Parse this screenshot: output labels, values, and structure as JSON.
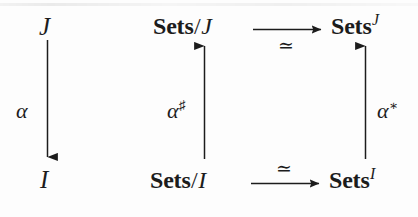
{
  "diagram": {
    "background_color": "#fdfdfd",
    "ink_color": "#1c1c1c",
    "nodes": {
      "top_left": {
        "text": "J"
      },
      "bottom_left": {
        "text": "I"
      },
      "top_mid": {
        "category": "Sets",
        "separator": "/",
        "index": "J"
      },
      "bottom_mid": {
        "category": "Sets",
        "separator": "/",
        "index": "I"
      },
      "top_right": {
        "category": "Sets",
        "superscript": "J"
      },
      "bottom_right": {
        "category": "Sets",
        "superscript": "I"
      }
    },
    "arrow_labels": {
      "alpha": {
        "base": "α",
        "sup": ""
      },
      "alpha_sharp": {
        "base": "α",
        "sup": "♯"
      },
      "alpha_star": {
        "base": "α",
        "sup": "∗"
      },
      "iso_top": {
        "text": "≃"
      },
      "iso_bottom": {
        "text": "≃"
      }
    },
    "arrows": [
      {
        "name": "alpha-arrow",
        "from": "J",
        "to": "I",
        "direction": "down",
        "label": "α"
      },
      {
        "name": "alpha-sharp-arrow",
        "from": "Sets/I",
        "to": "Sets/J",
        "direction": "up",
        "label": "α♯"
      },
      {
        "name": "alpha-star-arrow",
        "from": "Sets^I",
        "to": "Sets^J",
        "direction": "up",
        "label": "α∗"
      },
      {
        "name": "iso-top-arrow",
        "from": "Sets/J",
        "to": "Sets^J",
        "direction": "right",
        "label": "≃"
      },
      {
        "name": "iso-bottom-arrow",
        "from": "Sets/I",
        "to": "Sets^I",
        "direction": "right",
        "label": "≃"
      }
    ]
  }
}
